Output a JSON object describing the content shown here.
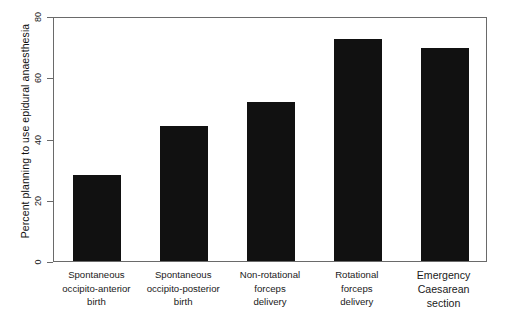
{
  "chart_data": {
    "type": "bar",
    "title": "",
    "xlabel": "",
    "ylabel": "Percent planning to use epidural anaesthesia",
    "ylim": [
      0,
      80
    ],
    "yticks": [
      0,
      20,
      40,
      60,
      80
    ],
    "ytick_labels": [
      "0",
      "20",
      "40",
      "60",
      "80"
    ],
    "grid": false,
    "legend": null,
    "bar_color": "#111111",
    "axis_color": "#6a6a6a",
    "categories": [
      "Spontaneous occipito-anterior birth",
      "Spontaneous occipito-posterior birth",
      "Non-rotational forceps delivery",
      "Rotational forceps delivery",
      "Emergency Caesarean section"
    ],
    "category_lines": [
      [
        "Spontaneous",
        "occipito-anterior",
        "birth"
      ],
      [
        "Spontaneous",
        "occipito-posterior",
        "birth"
      ],
      [
        "Non-rotational",
        "forceps",
        "delivery"
      ],
      [
        "Rotational",
        "forceps",
        "delivery"
      ],
      [
        "Emergency",
        "Caesarean",
        "section"
      ]
    ],
    "values": [
      28,
      44,
      52,
      72.5,
      69.5
    ]
  }
}
